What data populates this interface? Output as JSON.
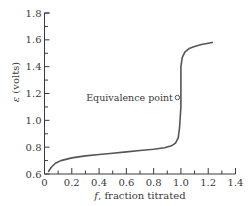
{
  "chart_data": {
    "type": "line",
    "title": "",
    "xlabel": "f, fraction titrated",
    "xlabel_italic_part": "f",
    "xlabel_rest": ", fraction titrated",
    "ylabel": "ε (volts)",
    "ylabel_symbol": "ε",
    "ylabel_rest": " (volts)",
    "xlim": [
      0,
      1.4
    ],
    "ylim": [
      0.6,
      1.8
    ],
    "x_ticks": [
      "0",
      "0.2",
      "0.4",
      "0.6",
      "0.8",
      "1.0",
      "1.2",
      "1.4"
    ],
    "y_ticks": [
      "0.6",
      "0.8",
      "1.0",
      "1.2",
      "1.4",
      "1.6",
      "1.8"
    ],
    "grid": false,
    "legend": null,
    "series": [
      {
        "name": "titration curve",
        "x": [
          0.03,
          0.05,
          0.08,
          0.12,
          0.2,
          0.3,
          0.4,
          0.5,
          0.6,
          0.7,
          0.8,
          0.88,
          0.93,
          0.96,
          0.98,
          0.99,
          1.0,
          1.0,
          1.0,
          1.01,
          1.03,
          1.06,
          1.1,
          1.15,
          1.2,
          1.23
        ],
        "y": [
          0.62,
          0.65,
          0.68,
          0.7,
          0.72,
          0.735,
          0.745,
          0.755,
          0.765,
          0.775,
          0.785,
          0.795,
          0.81,
          0.83,
          0.87,
          0.95,
          1.1,
          1.25,
          1.4,
          1.47,
          1.51,
          1.535,
          1.55,
          1.565,
          1.575,
          1.58
        ]
      }
    ],
    "annotations": [
      {
        "text": "Equivalence point",
        "x": 1.0,
        "y": 1.17,
        "marker": "open-circle"
      }
    ]
  }
}
